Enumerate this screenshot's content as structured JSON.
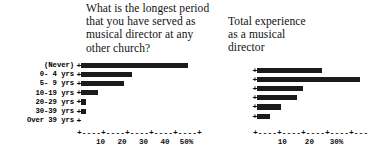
{
  "chart_data": [
    {
      "id": "longest-period-chart",
      "type": "bar",
      "orientation": "horizontal",
      "title": "What is the longest period\nthat you have served as\nmusical director at any\nother church?",
      "xlabel": "",
      "ylabel": "",
      "grid": false,
      "legend": null,
      "xlim": [
        0,
        55
      ],
      "xtick_values": [
        10,
        20,
        30,
        40,
        50
      ],
      "xtick_labels": [
        "10",
        "20",
        "30",
        "40",
        "50%"
      ],
      "categories": [
        "(Never)",
        "0- 4 yrs",
        "5- 9 yrs",
        "10-19 yrs",
        "20-29 yrs",
        "30-39 yrs",
        "Over 39 yrs"
      ],
      "values": [
        50,
        24,
        20,
        8,
        2.5,
        2.5,
        0
      ],
      "tick_marker": "+"
    },
    {
      "id": "total-experience-chart",
      "type": "bar",
      "orientation": "horizontal",
      "title": "Total experience\nas a musical\ndirector",
      "xlabel": "",
      "ylabel": "",
      "grid": false,
      "legend": null,
      "xlim": [
        0,
        41
      ],
      "xtick_values": [
        10,
        20,
        30
      ],
      "xtick_labels": [
        "10",
        "20",
        "30%"
      ],
      "categories": [
        "",
        "",
        "",
        "",
        "",
        ""
      ],
      "values": [
        24,
        38,
        17,
        15,
        9,
        5
      ],
      "tick_marker": "+"
    }
  ],
  "left_chart": {
    "title": "What is the longest period\nthat you have served as\nmusical director at any\nother church?",
    "axis_rule": "+----+----+----+----+----+",
    "categories": [
      "(Never)",
      "0- 4 yrs",
      "5- 9 yrs",
      "10-19 yrs",
      "20-29 yrs",
      "30-39 yrs",
      "Over 39 yrs"
    ],
    "tick_labels": [
      "10",
      "20",
      "30",
      "40",
      "50%"
    ]
  },
  "right_chart": {
    "title": "Total experience\nas a musical\ndirector",
    "axis_rule": "+----+----+----+----+---",
    "tick_labels": [
      "10",
      "20",
      "30%"
    ]
  }
}
